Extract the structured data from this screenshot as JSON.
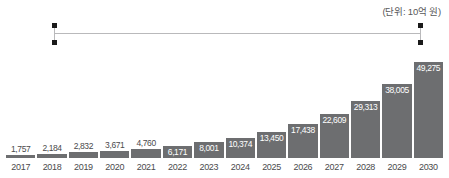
{
  "unit_note": "(단위: 10억 원)",
  "annotation": {
    "name": "range-bracket",
    "start_category": "2017",
    "end_category": "2030",
    "line_color": "#b9b9bb",
    "dot_color": "#1a1a1a"
  },
  "style": {
    "bar_color": "#6d6e70",
    "label_inside_color": "#ffffff",
    "label_above_color": "#4a4a4c",
    "tick_color": "#4a4a4c",
    "background": "#ffffff"
  },
  "chart_data": {
    "type": "bar",
    "title": "",
    "subtitle": "",
    "xlabel": "",
    "ylabel": "",
    "unit": "(단위: 10억 원)",
    "grid": false,
    "legend": false,
    "ylim": [
      0,
      49275
    ],
    "categories": [
      "2017",
      "2018",
      "2019",
      "2020",
      "2021",
      "2022",
      "2023",
      "2024",
      "2025",
      "2026",
      "2027",
      "2028",
      "2029",
      "2030"
    ],
    "values": [
      1757,
      2184,
      2832,
      3671,
      4760,
      6171,
      8001,
      10374,
      13450,
      17438,
      22609,
      29313,
      38005,
      49275
    ],
    "value_labels": [
      "1,757",
      "2,184",
      "2,832",
      "3,671",
      "4,760",
      "6,171",
      "8,001",
      "10,374",
      "13,450",
      "17,438",
      "22,609",
      "29,313",
      "38,005",
      "49,275"
    ],
    "label_placement": [
      "above",
      "above",
      "above",
      "above",
      "above",
      "inside",
      "inside",
      "inside",
      "inside",
      "inside",
      "inside",
      "inside",
      "inside",
      "inside"
    ]
  }
}
